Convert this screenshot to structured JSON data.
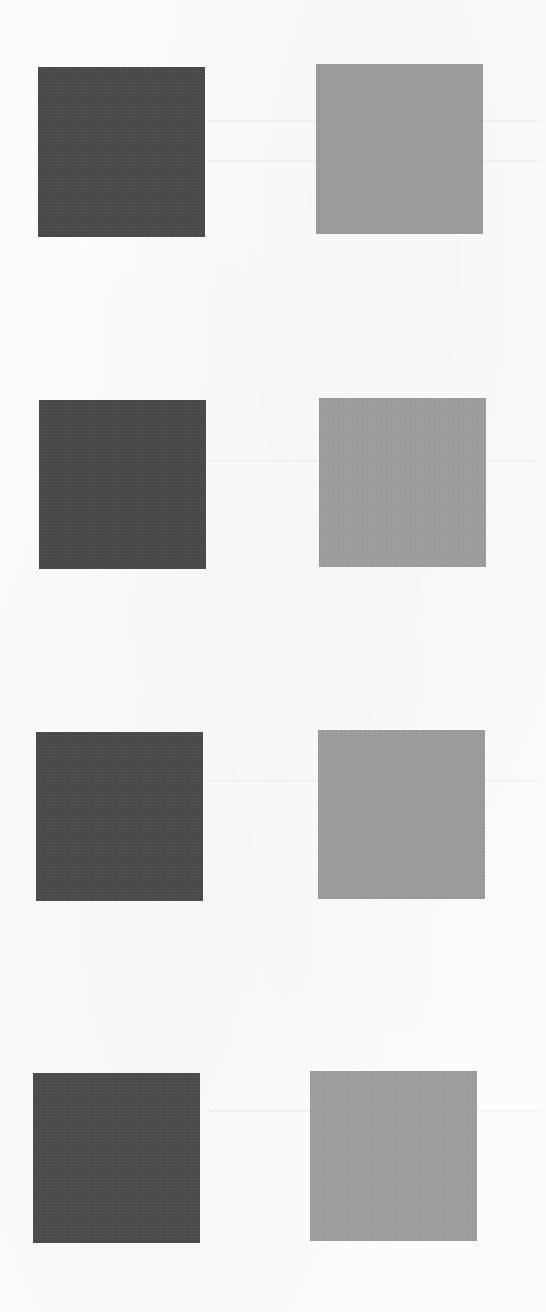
{
  "page": {
    "background_color": "#fcfcfc"
  },
  "swatch_rows": [
    {
      "left": {
        "color": "#4a4a4a",
        "tone": "dark"
      },
      "right": {
        "color": "#9c9c9c",
        "tone": "medium"
      }
    },
    {
      "left": {
        "color": "#494949",
        "tone": "dark"
      },
      "right": {
        "color": "#9d9d9d",
        "tone": "medium"
      }
    },
    {
      "left": {
        "color": "#4a4a4a",
        "tone": "dark"
      },
      "right": {
        "color": "#9c9c9c",
        "tone": "medium"
      }
    },
    {
      "left": {
        "color": "#4b4b4b",
        "tone": "dark"
      },
      "right": {
        "color": "#9e9e9e",
        "tone": "medium"
      }
    }
  ]
}
